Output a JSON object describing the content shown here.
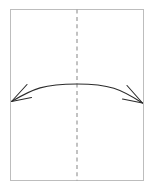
{
  "canvas": {
    "width": 153,
    "height": 188,
    "background_color": "#ffffff"
  },
  "diagram": {
    "type": "instructional-fold-diagram",
    "page_sheet": {
      "name": "paper-sheet",
      "x": 10.5,
      "y": 9.5,
      "width": 133,
      "height": 171,
      "stroke_color": "#bdbdbd",
      "stroke_width": 1,
      "fill_color": "#ffffff"
    },
    "fold_line": {
      "name": "center-fold-line",
      "orientation": "vertical",
      "x": 77,
      "y_start": 9.5,
      "y_end": 180.5,
      "stroke_color": "#9a9a9a",
      "stroke_width": 1.2,
      "dash_length": 4,
      "gap_length": 3.4
    },
    "arc_arrow": {
      "name": "double-headed-fold-arrow",
      "stroke_color": "#2b2b2b",
      "stroke_width": 1.1,
      "left_tip": {
        "x": 11.5,
        "y": 101.5
      },
      "right_tip": {
        "x": 142.5,
        "y": 103.0
      },
      "apex": {
        "x": 77,
        "y": 84.0
      },
      "control_left": {
        "x": 44,
        "y": 85.5
      },
      "control_right": {
        "x": 110,
        "y": 85.5
      },
      "arrowhead_style": "open-barbed",
      "arrowheads": [
        {
          "name": "left-arrowhead",
          "tip": {
            "x": 11.5,
            "y": 101.5
          },
          "barb_upper": {
            "x": 27.0,
            "y": 84.5
          },
          "barb_lower": {
            "x": 31.5,
            "y": 97.5
          }
        },
        {
          "name": "right-arrowhead",
          "tip": {
            "x": 142.5,
            "y": 103.0
          },
          "barb_upper": {
            "x": 127.0,
            "y": 85.5
          },
          "barb_lower": {
            "x": 122.5,
            "y": 99.0
          }
        }
      ]
    }
  },
  "chart_data": {
    "type": "line",
    "xlabel": "",
    "ylabel": "",
    "series": [
      {
        "name": "fold-arc",
        "x": [
          11.5,
          44,
          77,
          110,
          142.5
        ],
        "values": [
          101.5,
          88.5,
          84.0,
          88.5,
          103.0
        ]
      }
    ],
    "annotations": [
      "left-arrowhead",
      "right-arrowhead",
      "center-fold-line",
      "paper-sheet-outline"
    ],
    "xlim": [
      0,
      153
    ],
    "ylim": [
      0,
      188
    ],
    "grid": false,
    "legend": "none"
  }
}
